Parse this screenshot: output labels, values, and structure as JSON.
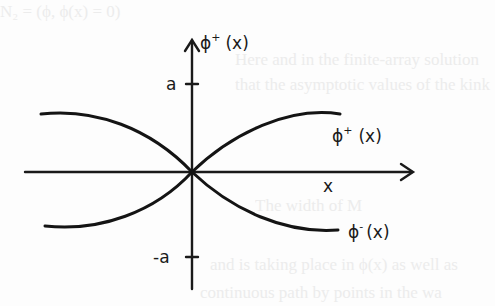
{
  "figure": {
    "y_axis_label": {
      "symbol": "ϕ",
      "superscript": "+",
      "argument": "(x)"
    },
    "x_axis_label": "x",
    "tick_upper_label": "a",
    "tick_lower_label": "-a",
    "curve_upper_label": {
      "symbol": "ϕ",
      "superscript": "+",
      "argument": "(x)"
    },
    "curve_lower_label": {
      "symbol": "ϕ",
      "superscript": "-",
      "argument": "(x)"
    },
    "curves": [
      {
        "name": "phi-plus",
        "description": "rises from -a (left) through origin to +a (right)"
      },
      {
        "name": "phi-minus",
        "description": "falls from +a (left) through origin to -a (right)"
      }
    ]
  },
  "background_bleed_text": [
    "N₂ = (ϕ, ϕ(x) = 0)",
    "Here and in the finite-array solution",
    "that the asymptotic values of the kink",
    "The width of   M",
    "and is taking place in ϕ(x) as well as",
    "continuous path by points in the wa"
  ]
}
